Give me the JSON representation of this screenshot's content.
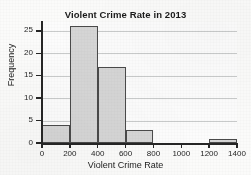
{
  "chart_data": {
    "type": "bar",
    "title": "Violent Crime Rate in 2013",
    "xlabel": "Violent Crime Rate",
    "ylabel": "Frequency",
    "grid": "horizontal",
    "legend": null,
    "xlim": [
      0,
      1400
    ],
    "ylim": [
      0,
      27
    ],
    "xticks": [
      0,
      200,
      400,
      600,
      800,
      1000,
      1200,
      1400
    ],
    "yticks": [
      0,
      5,
      10,
      15,
      20,
      25
    ],
    "bin_width": 200,
    "bins": [
      {
        "label": "0-200",
        "start": 0,
        "end": 200,
        "value": 4
      },
      {
        "label": "200-400",
        "start": 200,
        "end": 400,
        "value": 26
      },
      {
        "label": "400-600",
        "start": 400,
        "end": 600,
        "value": 17
      },
      {
        "label": "600-800",
        "start": 600,
        "end": 800,
        "value": 3
      },
      {
        "label": "800-1000",
        "start": 800,
        "end": 1000,
        "value": 0
      },
      {
        "label": "1000-1200",
        "start": 1000,
        "end": 1200,
        "value": 0
      },
      {
        "label": "1200-1400",
        "start": 1200,
        "end": 1400,
        "value": 1
      }
    ],
    "categories": [
      "0-200",
      "200-400",
      "400-600",
      "600-800",
      "800-1000",
      "1000-1200",
      "1200-1400"
    ],
    "values": [
      4,
      26,
      17,
      3,
      0,
      0,
      1
    ],
    "colors": {
      "bar_fill": "#d6d6d6",
      "bar_edge": "#4a4a4a",
      "grid": "#c9cbcb",
      "axis": "#262626",
      "text": "#1b1b1b",
      "background": "#fbfbfa"
    }
  }
}
